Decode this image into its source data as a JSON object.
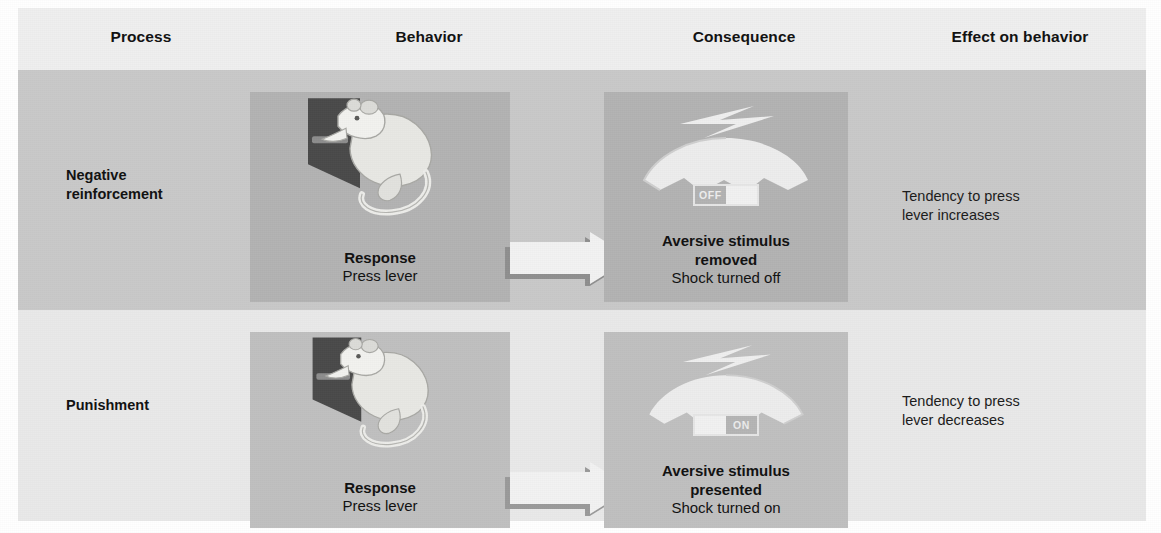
{
  "figure": {
    "columns": [
      {
        "key": "process",
        "label": "Process"
      },
      {
        "key": "behavior",
        "label": "Behavior"
      },
      {
        "key": "consequence",
        "label": "Consequence"
      },
      {
        "key": "effect",
        "label": "Effect on behavior"
      }
    ],
    "rows": [
      {
        "process": "Negative\nreinforcement",
        "process_line1": "Negative",
        "process_line2": "reinforcement",
        "behavior": {
          "art": "rat-pressing-lever",
          "caption_strong": "Response",
          "caption_sub": "Press lever"
        },
        "arrow": {
          "icon": "right-arrow-icon"
        },
        "consequence": {
          "art": "shock-generator-icon",
          "switch_state": "OFF",
          "switch_label": "OFF",
          "caption_strong_line1": "Aversive stimulus",
          "caption_strong_line2": "removed",
          "caption_sub": "Shock turned off"
        },
        "effect_line1": "Tendency to press",
        "effect_line2": "lever increases"
      },
      {
        "process": "Punishment",
        "process_line1": "Punishment",
        "process_line2": "",
        "behavior": {
          "art": "rat-pressing-lever",
          "caption_strong": "Response",
          "caption_sub": "Press lever"
        },
        "arrow": {
          "icon": "right-arrow-icon"
        },
        "consequence": {
          "art": "shock-generator-icon",
          "switch_state": "ON",
          "switch_label": "ON",
          "caption_strong_line1": "Aversive stimulus",
          "caption_strong_line2": "presented",
          "caption_sub": "Shock turned on"
        },
        "effect_line1": "Tendency to press",
        "effect_line2": "lever decreases"
      }
    ],
    "colors": {
      "page_background": "#ffffff",
      "header_background": "#efefef",
      "row1_background": "#c9c9c9",
      "row2_background": "#e9e9e9",
      "row1_panel": "#b3b3b3",
      "row2_panel": "#c0c0c0",
      "text": "#111111",
      "arrow_fill": "#f2f2f2",
      "arrow_shadow": "#8f8f8f",
      "artwork_light": "#eeeeee",
      "artwork_dark": "#4a4a4a"
    }
  }
}
